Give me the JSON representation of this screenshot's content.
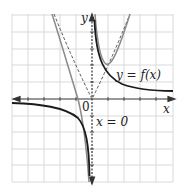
{
  "diagram": {
    "type": "function-graph",
    "labels": {
      "x_axis": "x",
      "y_axis": "y",
      "origin": "0",
      "function": "y = f(x)",
      "asymptote": "x = 0"
    },
    "colors": {
      "grid": "#d9d9d9",
      "axis": "#333333",
      "curve_main": "#1a1a1a",
      "curve_sum": "#8a8a8a",
      "dashed": "#555555"
    },
    "curves": [
      {
        "name": "reciprocal",
        "style": "solid-thick",
        "description": "y = 1/x style hyperbola, both branches"
      },
      {
        "name": "parabola",
        "style": "dashed",
        "description": "y = x^2"
      },
      {
        "name": "f",
        "style": "solid-gray",
        "description": "y = x^2 + 1/x"
      }
    ],
    "grid": {
      "columns": 10,
      "rows": 10
    }
  }
}
